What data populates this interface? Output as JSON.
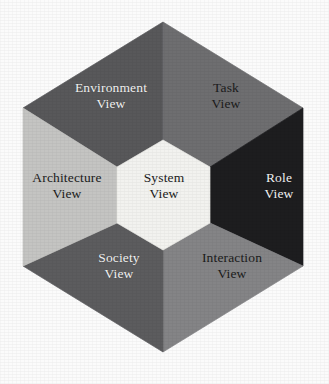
{
  "figure": {
    "kind": "hexagon-view-model-diagram",
    "background_color": "#fbfbfb",
    "geometry": {
      "outer_top_apex": [
        163,
        22
      ],
      "outer_bottom_apex": [
        163,
        352
      ],
      "outer_left_upper": [
        23,
        108
      ],
      "outer_left_lower": [
        23,
        266
      ],
      "outer_right_upper": [
        303,
        108
      ],
      "outer_right_lower": [
        303,
        266
      ],
      "inner_top_apex": [
        163,
        140
      ],
      "inner_bottom_apex": [
        163,
        250
      ],
      "inner_left_upper": [
        117,
        167
      ],
      "inner_left_lower": [
        117,
        223
      ],
      "inner_right_upper": [
        210,
        167
      ],
      "inner_right_lower": [
        210,
        223
      ]
    },
    "segments": [
      {
        "id": "environment-view",
        "name": "Environment View",
        "lines": [
          "Environment",
          "View"
        ],
        "fill": "#58585a",
        "text_color": "#f4f4f4",
        "position": "top-left"
      },
      {
        "id": "task-view",
        "name": "Task View",
        "lines": [
          "Task",
          "View"
        ],
        "fill": "#6e6e70",
        "text_color": "#1b1b1b",
        "position": "top-right"
      },
      {
        "id": "role-view",
        "name": "Role View",
        "lines": [
          "Role",
          "View"
        ],
        "fill": "#1d1d1f",
        "text_color": "#f4f4f4",
        "position": "right"
      },
      {
        "id": "interaction-view",
        "name": "Interaction View",
        "lines": [
          "Interaction",
          "View"
        ],
        "fill": "#848486",
        "text_color": "#1b1b1b",
        "position": "bottom-right"
      },
      {
        "id": "society-view",
        "name": "Society View",
        "lines": [
          "Society",
          "View"
        ],
        "fill": "#5c5c5e",
        "text_color": "#f4f4f4",
        "position": "bottom-left"
      },
      {
        "id": "architecture-view",
        "name": "Architecture View",
        "lines": [
          "Architecture",
          "View"
        ],
        "fill": "#c4c4c2",
        "text_color": "#1b1b1b",
        "position": "left"
      },
      {
        "id": "system-view",
        "name": "System View",
        "lines": [
          "System",
          "View"
        ],
        "fill": "#f2f2ef",
        "text_color": "#1b1b1b",
        "position": "center"
      }
    ]
  }
}
